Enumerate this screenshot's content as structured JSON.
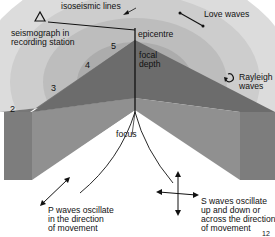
{
  "diagram": {
    "labels": {
      "isoseismic": "isoseismic lines",
      "epicentre": "epicentre",
      "seismograph_line1": "seismograph in",
      "seismograph_line2": "recording station",
      "love": "Love waves",
      "focal_line1": "focal",
      "focal_line2": "depth",
      "rayleigh_line1": "Rayleigh",
      "rayleigh_line2": "waves",
      "focus": "focus",
      "p_line1": "P waves oscillate",
      "p_line2": "in the direction",
      "p_line3": "of movement",
      "s_line1": "S waves oscillate",
      "s_line2": "up and down or",
      "s_line3": "across the direction",
      "s_line4": "of movement",
      "page_number": "12"
    },
    "intensity_zones": [
      "2",
      "3",
      "4",
      "5"
    ],
    "icons": {
      "seismograph": "triangle-icon",
      "love": "double-arrow-icon",
      "rayleigh": "curved-arrow-icon",
      "p_wave": "double-arrow-icon",
      "s_wave": "cross-arrow-icon"
    },
    "colors": {
      "ring_outer": "#d9d9d9",
      "ring_2": "#c9c9c9",
      "ring_3": "#b8b8b8",
      "ring_inner": "#a6a6a6",
      "block_top": "#6e6e6e",
      "block_face": "#8a8a8a",
      "block_end": "#7c7c7c"
    }
  }
}
